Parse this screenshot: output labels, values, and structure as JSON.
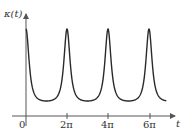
{
  "chart_data": {
    "type": "line",
    "title": "",
    "xlabel": "t",
    "ylabel": "κ(t)",
    "x_ticks": [
      "0",
      "2π",
      "4π",
      "6π"
    ],
    "x_tick_values": [
      0,
      6.2832,
      12.5664,
      18.8496
    ],
    "peaks_at": [
      0,
      6.2832,
      12.5664,
      18.8496
    ],
    "minima_at": [
      3.1416,
      9.4248,
      15.708
    ],
    "xlim": [
      0,
      21.5
    ],
    "grid": false,
    "legend": null
  },
  "labels": {
    "y_axis": "κ(t)",
    "x_axis": "t",
    "origin": "0",
    "tick_2pi": "2π",
    "tick_4pi": "4π",
    "tick_6pi": "6π"
  },
  "colors": {
    "curve": "#2a2a2a",
    "axis": "#555555"
  }
}
